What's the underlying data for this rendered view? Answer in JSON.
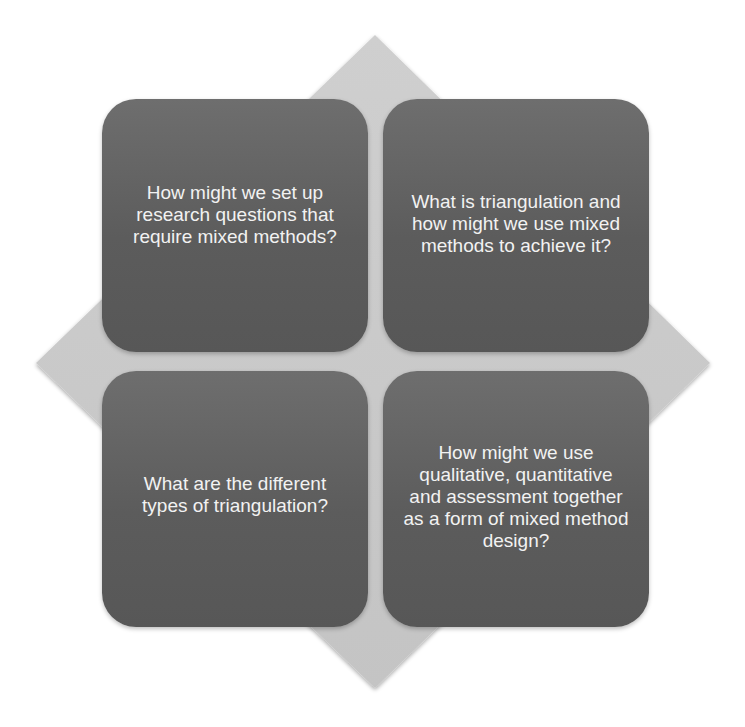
{
  "diagram": {
    "type": "matrix-on-diamond",
    "background_shape": "diamond",
    "colors": {
      "diamond_fill": "#c9c9c9",
      "box_fill": "#606060",
      "box_text": "#f2f2f2"
    },
    "quadrants": [
      {
        "position": "top-left",
        "text": "How might we set up research questions that require mixed methods?"
      },
      {
        "position": "top-right",
        "text": "What is triangulation and how might we use mixed methods to achieve it?"
      },
      {
        "position": "bottom-left",
        "text": "What are the different types of triangulation?"
      },
      {
        "position": "bottom-right",
        "text": "How might we use qualitative, quantitative and assessment together as a form of mixed method design?"
      }
    ]
  }
}
